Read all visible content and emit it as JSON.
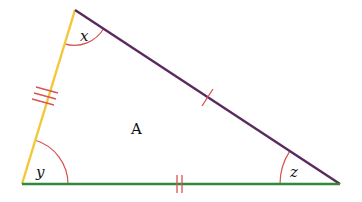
{
  "diagram": {
    "type": "triangle",
    "name": "A",
    "vertices": {
      "top": [
        75,
        10
      ],
      "bottom_left": [
        22,
        184
      ],
      "bottom_right": [
        340,
        184
      ]
    },
    "sides": [
      {
        "id": "left",
        "from": "top",
        "to": "bottom_left",
        "color": "#f2c83a",
        "tick_marks": 3
      },
      {
        "id": "hypotenuse",
        "from": "top",
        "to": "bottom_right",
        "color": "#5a2a5e",
        "tick_marks": 1
      },
      {
        "id": "base",
        "from": "bottom_left",
        "to": "bottom_right",
        "color": "#2f8a3a",
        "tick_marks": 2
      }
    ],
    "angles": [
      {
        "label": "x",
        "vertex": "top"
      },
      {
        "label": "y",
        "vertex": "bottom_left"
      },
      {
        "label": "z",
        "vertex": "bottom_right"
      }
    ],
    "tick_color": "#d9534f",
    "arc_color": "#d9534f"
  },
  "labels": {
    "region": "A",
    "angle_top": "x",
    "angle_left": "y",
    "angle_right": "z"
  }
}
